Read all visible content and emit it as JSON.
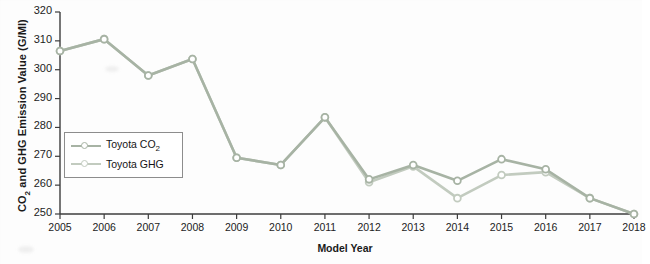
{
  "chart_data": {
    "type": "line",
    "title": "",
    "xlabel": "Model Year",
    "ylabel": "CO2 and GHG Emission Value (G/MI)",
    "ylabel_parts": {
      "pre": "CO",
      "sub": "2",
      "post": " and GHG Emission Value (G/MI)"
    },
    "categories": [
      2005,
      2006,
      2007,
      2008,
      2009,
      2010,
      2011,
      2012,
      2013,
      2014,
      2015,
      2016,
      2017,
      2018
    ],
    "x_tick_labels": [
      "2005",
      "2006",
      "2007",
      "2008",
      "2009",
      "2010",
      "2011",
      "2012",
      "2013",
      "2014",
      "2015",
      "2016",
      "2017",
      "2018"
    ],
    "y_tick_labels": [
      "320",
      "310",
      "300",
      "290",
      "280",
      "270",
      "260",
      "250"
    ],
    "y_ticks": [
      320,
      310,
      300,
      290,
      280,
      270,
      260,
      250
    ],
    "ylim": [
      250,
      320
    ],
    "xlim": [
      2005,
      2018
    ],
    "grid": false,
    "legend_position": "center-left",
    "series": [
      {
        "name": "Toyota CO2",
        "name_parts": {
          "pre": "Toyota CO",
          "sub": "2"
        },
        "color": "#a7b3a4",
        "marker": "circle-open",
        "values": [
          306.5,
          310.6,
          298.0,
          303.7,
          269.5,
          267.0,
          283.5,
          262.0,
          267.0,
          261.5,
          269.0,
          265.5,
          255.5,
          250.0
        ]
      },
      {
        "name": "Toyota GHG",
        "name_parts": {
          "pre": "Toyota GHG",
          "sub": ""
        },
        "color": "#c2cbbf",
        "marker": "circle-open",
        "values": [
          306.5,
          310.6,
          298.0,
          303.7,
          269.5,
          267.0,
          283.5,
          261.0,
          266.5,
          255.5,
          263.5,
          264.5,
          255.5,
          250.0
        ]
      }
    ]
  },
  "figure": {
    "axis_color": "#3c3c3c",
    "background": "#fdfdfd",
    "plot_background": "#ffffff"
  }
}
